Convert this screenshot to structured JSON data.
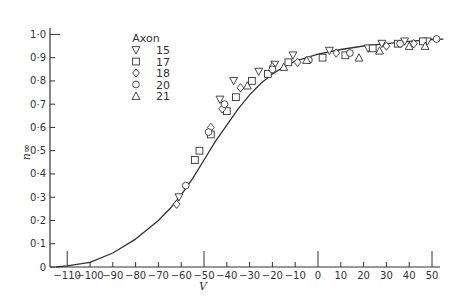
{
  "chart_data": {
    "type": "scatter",
    "title": "",
    "xlabel": "V",
    "ylabel": "n∞",
    "xlim": [
      -115,
      55
    ],
    "ylim": [
      0,
      1.0
    ],
    "x_ticks": [
      -110,
      -100,
      -90,
      -80,
      -70,
      -60,
      -50,
      -40,
      -30,
      -20,
      -10,
      0,
      10,
      20,
      30,
      40,
      50
    ],
    "x_tick_labels": [
      "-110",
      "-100",
      "-90",
      "-80",
      "-70",
      "-60",
      "-50",
      "-40",
      "-30",
      "-20",
      "-10",
      "0",
      "10",
      "20",
      "30",
      "40",
      "50"
    ],
    "y_ticks": [
      0,
      0.1,
      0.2,
      0.3,
      0.4,
      0.5,
      0.6,
      0.7,
      0.8,
      0.9,
      1.0
    ],
    "y_tick_labels": [
      "0",
      "0·1",
      "0·2",
      "0·3",
      "0·4",
      "0·5",
      "0·6",
      "0·7",
      "0·8",
      "0·9",
      "1·0"
    ],
    "grid": false,
    "legend": {
      "title": "Axon",
      "position": "upper-left",
      "entries": [
        {
          "label": "15",
          "marker": "triangle-down"
        },
        {
          "label": "17",
          "marker": "square"
        },
        {
          "label": "18",
          "marker": "diamond"
        },
        {
          "label": "20",
          "marker": "circle"
        },
        {
          "label": "21",
          "marker": "triangle-up"
        }
      ]
    },
    "fit_curve": {
      "description": "Boltzmann-like steady-state activation curve",
      "x": [
        -115,
        -110,
        -100,
        -90,
        -80,
        -70,
        -65,
        -60,
        -55,
        -50,
        -45,
        -40,
        -35,
        -30,
        -25,
        -20,
        -15,
        -10,
        -5,
        0,
        10,
        20,
        30,
        40,
        50,
        55
      ],
      "y": [
        0.0,
        0.005,
        0.02,
        0.06,
        0.12,
        0.2,
        0.25,
        0.31,
        0.38,
        0.46,
        0.54,
        0.61,
        0.68,
        0.74,
        0.79,
        0.83,
        0.86,
        0.885,
        0.9,
        0.915,
        0.935,
        0.95,
        0.96,
        0.97,
        0.978,
        0.98
      ]
    },
    "series": [
      {
        "name": "15",
        "marker": "triangle-down",
        "x": [
          -61,
          -43,
          -37,
          -26,
          -19,
          -11,
          5,
          22,
          28,
          38,
          48
        ],
        "y": [
          0.3,
          0.72,
          0.8,
          0.84,
          0.87,
          0.91,
          0.93,
          0.94,
          0.96,
          0.97,
          0.97
        ]
      },
      {
        "name": "17",
        "marker": "square",
        "x": [
          -54,
          -52,
          -47,
          -40,
          -36,
          -29,
          -22,
          -13,
          2,
          12,
          24,
          35,
          46
        ],
        "y": [
          0.46,
          0.5,
          0.57,
          0.67,
          0.73,
          0.8,
          0.83,
          0.88,
          0.9,
          0.91,
          0.94,
          0.96,
          0.97
        ]
      },
      {
        "name": "18",
        "marker": "diamond",
        "x": [
          -62,
          -47,
          -42,
          -34,
          -20,
          -9,
          8,
          30,
          42
        ],
        "y": [
          0.27,
          0.6,
          0.68,
          0.77,
          0.86,
          0.88,
          0.92,
          0.95,
          0.96
        ]
      },
      {
        "name": "20",
        "marker": "circle",
        "x": [
          -58,
          -48,
          -41,
          -20,
          -4,
          14,
          36,
          52
        ],
        "y": [
          0.35,
          0.58,
          0.7,
          0.85,
          0.89,
          0.92,
          0.96,
          0.98
        ]
      },
      {
        "name": "21",
        "marker": "triangle-up",
        "x": [
          -31,
          -15,
          -5,
          18,
          27,
          40,
          47
        ],
        "y": [
          0.78,
          0.86,
          0.89,
          0.9,
          0.93,
          0.95,
          0.95
        ]
      }
    ]
  },
  "layout": {
    "plot": {
      "x0": 318,
      "px_per_unit_x": 2.28,
      "y0": 267,
      "px_per_unit_y": 232.6,
      "left": 50,
      "right": 440,
      "top": 28
    },
    "colors": {
      "ink": "#333333",
      "background": "#ffffff"
    }
  }
}
